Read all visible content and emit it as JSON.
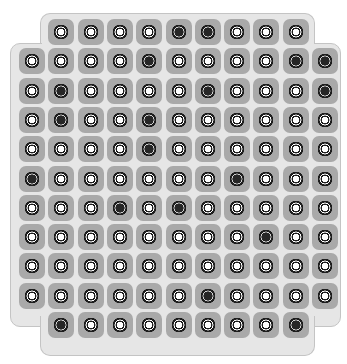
{
  "board": {
    "rows": 11,
    "cols": 11,
    "colors": {
      "background": "#e6e6e6",
      "border": "#c4c4c4",
      "cell": "#a9a9a9",
      "dark_piece": "#262626",
      "white_piece": "#ffffff"
    },
    "layout": "Row strings: '-' = no cell (board notch), 'W' = light peg, 'D' = dark peg",
    "cells": [
      "-WWWWDDWWW-",
      "WWWWDWWWWDD",
      "WDWWWWDWWWD",
      "WDWWDWWWWWW",
      "WWWWDWWWWWW",
      "DWWWWWWDWWW",
      "WWWDWDWWWWW",
      "WWWWWWWWDWW",
      "WWWWWWWWWWW",
      "WWWWWWDWWWW",
      "-DWWWWWWWD-"
    ]
  }
}
